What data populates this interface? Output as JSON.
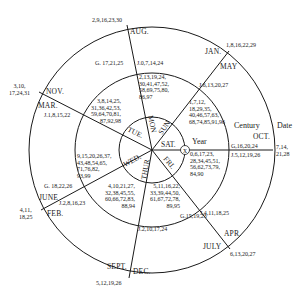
{
  "diagram": {
    "type": "perpetual-calendar-wheel",
    "ring_headers": {
      "year": "Year",
      "century": "Century",
      "date": "Date"
    },
    "center_marker": "X",
    "days": [
      "SUN",
      "MON",
      "TUE",
      "WED",
      "THUR",
      "FRI",
      "SAT."
    ],
    "day_labels": {
      "sun": "SUN",
      "mon": "MON",
      "tue": "TUE.",
      "wed": "WED.",
      "thur": "THUR",
      "fri": "FRI.",
      "sat": "SAT."
    },
    "sectors": [
      {
        "id": "sat-sun",
        "year_values": "1,7,12,\n18,29,35,\n40,46,57,63,\n68,74,85,91,96",
        "century_values": "J.6,13,20,27",
        "months": "JAN.\n  MAY",
        "date_values": "1,8,16,22,29"
      },
      {
        "id": "sun-mon",
        "year_values": "2,13,19,24,\n30,41,47,52,\n58,69,75,80,\n86,97",
        "century_values": "J.0,7,14,24",
        "century_values_left": "G. 17,21,25",
        "months": "AUG.",
        "date_values": "2,9,16,23,30"
      },
      {
        "id": "mon-tue",
        "year_values": "3,8,14,25,\n31,36,42,53,\n59,64,70,81,\n87,92,98",
        "century_values": "J.1,8,15,22",
        "months_upper": "NOV.",
        "months_lower": "MAR.",
        "date_values": "3,10,\n17,24,31"
      },
      {
        "id": "tue-wed",
        "year_values": "9,15,20,26,37,\n43,48,54,65,\n71,76,82,\n93,99",
        "century_values": "G. 18,22,26",
        "century_values_lower": "J.2,8,16,23",
        "months_upper": "JUNE",
        "months_lower": "FEB.",
        "date_values": "4,11,\n18,25"
      },
      {
        "id": "wed-thur",
        "year_values": "4,10,21,27,\n32,38,45,55,\n60,66,72,83,\n88,94",
        "century_values": "J.2,10,17,24",
        "months_left": "SEPT.",
        "months_right": "DEC.",
        "date_values": "5,12,19,26"
      },
      {
        "id": "thur-fri",
        "year_values": "5,11,16,22,\n33,39,44,50,\n61,67,72,78,\n89,95",
        "century_values": "G.15,19,23",
        "century_values_right": "J.4,11,18,25",
        "months_upper": "APR.",
        "months_lower": "JULY",
        "date_values": "6,13,20,27"
      },
      {
        "id": "fri-sat",
        "year_values": "0,6,17,23,\n28,34,45,51,\n56,62,73,79,\n84,90",
        "century_values_upper": "G,16,20,24",
        "century_values_lower": "J.5,12,19,26",
        "months": "OCT.",
        "date_values": "7,14,\n21,28"
      }
    ]
  }
}
